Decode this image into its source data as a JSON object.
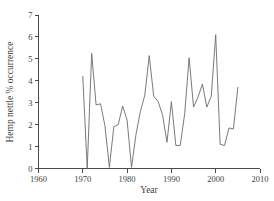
{
  "chart_data": {
    "type": "line",
    "title": "",
    "xlabel": "Year",
    "ylabel": "Hemp nettle % occurrence",
    "xlim": [
      1960,
      2010
    ],
    "ylim": [
      0,
      7
    ],
    "xticks": [
      1960,
      1970,
      1980,
      1990,
      2000,
      2010
    ],
    "xtick_labels": [
      "1960",
      "1970",
      "1980",
      "1990",
      "2000",
      "2010"
    ],
    "yticks": [
      0,
      1,
      2,
      3,
      4,
      5,
      6,
      7
    ],
    "ytick_labels": [
      "0",
      "1",
      "2",
      "3",
      "4",
      "5",
      "6",
      "7"
    ],
    "grid": false,
    "legend": null,
    "line_color": "#6b6b6b",
    "axis_color": "#4a4a4a",
    "series": [
      {
        "name": "Hemp nettle % occurrence",
        "x": [
          1970,
          1971,
          1972,
          1973,
          1974,
          1975,
          1976,
          1977,
          1978,
          1979,
          1980,
          1981,
          1982,
          1983,
          1984,
          1985,
          1986,
          1987,
          1988,
          1989,
          1990,
          1991,
          1992,
          1993,
          1994,
          1995,
          1996,
          1997,
          1998,
          1999,
          2000,
          2001,
          2002,
          2003,
          2004,
          2005
        ],
        "values": [
          4.2,
          0.0,
          5.25,
          2.9,
          2.95,
          1.95,
          0.05,
          1.9,
          2.0,
          2.85,
          2.2,
          0.05,
          1.55,
          2.6,
          3.35,
          5.15,
          3.3,
          3.05,
          2.45,
          1.2,
          3.05,
          1.05,
          1.05,
          2.5,
          5.05,
          2.8,
          3.25,
          3.85,
          2.8,
          3.3,
          6.1,
          1.1,
          1.05,
          1.85,
          1.8,
          3.7
        ]
      }
    ]
  },
  "axis_labels": {
    "x_title": "Year",
    "y_title": "Hemp nettle % occurrence"
  }
}
